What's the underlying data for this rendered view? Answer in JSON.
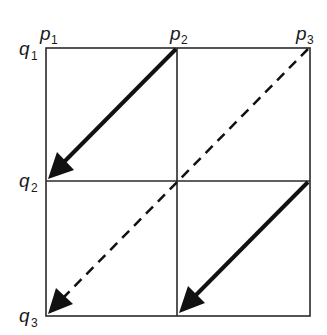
{
  "diagram": {
    "columns": [
      {
        "base": "p",
        "sub": "1"
      },
      {
        "base": "p",
        "sub": "2"
      },
      {
        "base": "p",
        "sub": "3"
      }
    ],
    "rows": [
      {
        "base": "q",
        "sub": "1"
      },
      {
        "base": "q",
        "sub": "2"
      },
      {
        "base": "q",
        "sub": "3"
      }
    ],
    "arrows": [
      {
        "from": "p2,q1",
        "to": "p1,q2",
        "style": "solid"
      },
      {
        "from": "p3,q1",
        "to": "p1,q3",
        "style": "dashed"
      },
      {
        "from": "p3,q2",
        "to": "p2,q3",
        "style": "solid"
      }
    ],
    "colors": {
      "line": "#1a1a1a",
      "background": "#ffffff"
    }
  }
}
